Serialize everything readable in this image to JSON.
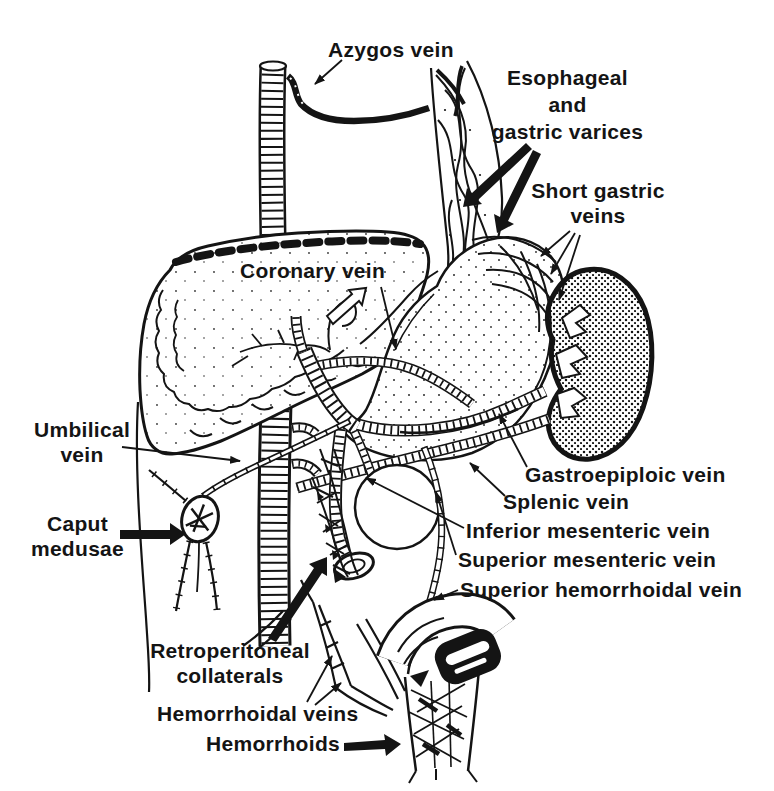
{
  "labels": {
    "azygos_vein": "Azygos vein",
    "esophageal_gastric_varices": "Esophageal\nand\ngastric varices",
    "short_gastric_veins": "Short gastric\nveins",
    "coronary_vein": "Coronary vein",
    "umbilical_vein": "Umbilical\nvein",
    "caput_medusae": "Caput\nmedusae",
    "gastroepiploic_vein": "Gastroepiploic vein",
    "splenic_vein": "Splenic vein",
    "inferior_mesenteric_vein": "Inferior mesenteric vein",
    "superior_mesenteric_vein": "Superior mesenteric vein",
    "superior_hemorrhoidal_vein": "Superior hemorrhoidal vein",
    "retroperitoneal_collaterals": "Retroperitoneal\ncollaterals",
    "hemorrhoidal_veins": "Hemorrhoidal veins",
    "hemorrhoids": "Hemorrhoids"
  },
  "colors": {
    "ink": "#141414",
    "paper": "#ffffff"
  }
}
